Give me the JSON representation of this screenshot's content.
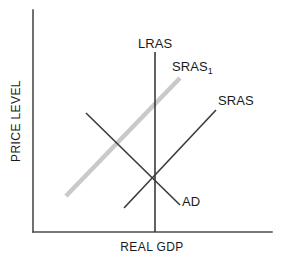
{
  "figure": {
    "kind": "ad-as-macroeconomic-diagram",
    "background_color": "#ffffff"
  },
  "axes": {
    "y_label": "PRICE LEVEL",
    "x_label": "REAL GDP",
    "axis_color": "#4d4d4d",
    "origin": [
      33,
      232
    ],
    "y_top": 10,
    "x_right": 272,
    "ticks": [],
    "gridlines": false
  },
  "labels": {
    "lras": "LRAS",
    "sras1_base": "SRAS",
    "sras1_subscript": "1",
    "sras": "SRAS",
    "ad": "AD"
  },
  "colors": {
    "dark_line": "#3a3a3a",
    "gray_line": "#c9c9c9",
    "axis": "#4d4d4d",
    "text": "#1a1a1a"
  },
  "chart_data": {
    "type": "line",
    "title": "",
    "xlabel": "REAL GDP",
    "ylabel": "PRICE LEVEL",
    "xlim": [
      33,
      272
    ],
    "ylim": [
      232,
      10
    ],
    "grid": false,
    "legend": "inline-curve-labels",
    "axis_ticks": {
      "x": [],
      "y": []
    },
    "series": [
      {
        "name": "LRAS",
        "label": "LRAS",
        "color": "#3a3a3a",
        "width": 1.6,
        "style": "vertical",
        "points": [
          [
            155,
            52
          ],
          [
            155,
            232
          ]
        ],
        "label_pos": [
          138,
          48
        ]
      },
      {
        "name": "SRAS1",
        "label": "SRAS1",
        "color": "#c9c9c9",
        "width": 4.5,
        "style": "upward-sloping",
        "points": [
          [
            66,
            196
          ],
          [
            180,
            78
          ]
        ],
        "label_pos": [
          172,
          71
        ]
      },
      {
        "name": "SRAS",
        "label": "SRAS",
        "color": "#3a3a3a",
        "width": 1.6,
        "style": "upward-sloping",
        "points": [
          [
            124,
            208
          ],
          [
            216,
            110
          ]
        ],
        "label_pos": [
          218,
          105
        ]
      },
      {
        "name": "AD",
        "label": "AD",
        "color": "#3a3a3a",
        "width": 1.6,
        "style": "downward-sloping",
        "points": [
          [
            86,
            113
          ],
          [
            180,
            205
          ]
        ],
        "label_pos": [
          182,
          206
        ]
      }
    ],
    "annotations": [
      {
        "name": "equilibrium",
        "x": 155,
        "y": 186,
        "text": ""
      }
    ]
  }
}
